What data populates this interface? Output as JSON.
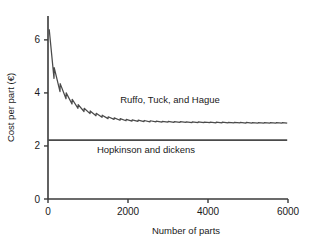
{
  "chart_data": {
    "type": "line",
    "title": "",
    "xlabel": "Number of parts",
    "ylabel": "Cost per part (€)",
    "xlim": [
      0,
      6000
    ],
    "ylim": [
      0,
      6.9
    ],
    "grid": false,
    "legend_position": "inline-annotation",
    "xticks": [
      0,
      2000,
      4000,
      6000
    ],
    "xtick_labels": [
      "0",
      "2000",
      "4000",
      "6000"
    ],
    "yticks": [
      0,
      2,
      4,
      6
    ],
    "ytick_labels": [
      "0",
      "2",
      "4",
      "6"
    ],
    "annotations": [
      {
        "text": "Ruffo, Tuck, and Hague",
        "x": 3050,
        "y": 3.62
      },
      {
        "text": "Hopkinson and dickens",
        "x": 2450,
        "y": 1.72
      }
    ],
    "series": [
      {
        "name": "Ruffo, Tuck, and Hague",
        "shape": "decaying sawtooth, batch-step cost curve",
        "asymptote": 2.88,
        "start_value": 6.4,
        "sawtooth_period_parts": 150,
        "points": [
          [
            30,
            6.4
          ],
          [
            150,
            4.55
          ],
          [
            155,
            4.95
          ],
          [
            300,
            4.05
          ],
          [
            305,
            4.35
          ],
          [
            450,
            3.78
          ],
          [
            455,
            4.0
          ],
          [
            600,
            3.58
          ],
          [
            605,
            3.76
          ],
          [
            750,
            3.42
          ],
          [
            755,
            3.56
          ],
          [
            900,
            3.3
          ],
          [
            905,
            3.42
          ],
          [
            1050,
            3.22
          ],
          [
            1055,
            3.32
          ],
          [
            1200,
            3.14
          ],
          [
            1205,
            3.23
          ],
          [
            1350,
            3.08
          ],
          [
            1355,
            3.16
          ],
          [
            1500,
            3.03
          ],
          [
            1505,
            3.1
          ],
          [
            1650,
            3.0
          ],
          [
            1655,
            3.06
          ],
          [
            1800,
            2.97
          ],
          [
            1805,
            3.03
          ],
          [
            1950,
            2.95
          ],
          [
            1955,
            3.0
          ],
          [
            2100,
            2.94
          ],
          [
            2105,
            2.98
          ],
          [
            2250,
            2.93
          ],
          [
            2255,
            2.97
          ],
          [
            2400,
            2.92
          ],
          [
            2405,
            2.96
          ],
          [
            2550,
            2.91
          ],
          [
            2555,
            2.95
          ],
          [
            2700,
            2.91
          ],
          [
            2705,
            2.94
          ],
          [
            2850,
            2.9
          ],
          [
            2855,
            2.93
          ],
          [
            3000,
            2.9
          ],
          [
            3005,
            2.93
          ],
          [
            3150,
            2.89
          ],
          [
            3155,
            2.92
          ],
          [
            3300,
            2.89
          ],
          [
            3305,
            2.92
          ],
          [
            3450,
            2.89
          ],
          [
            3455,
            2.91
          ],
          [
            3600,
            2.88
          ],
          [
            3605,
            2.91
          ],
          [
            3750,
            2.88
          ],
          [
            3755,
            2.91
          ],
          [
            3900,
            2.88
          ],
          [
            3905,
            2.9
          ],
          [
            4050,
            2.88
          ],
          [
            4055,
            2.9
          ],
          [
            4200,
            2.87
          ],
          [
            4205,
            2.9
          ],
          [
            4350,
            2.87
          ],
          [
            4355,
            2.9
          ],
          [
            4500,
            2.87
          ],
          [
            4505,
            2.89
          ],
          [
            4650,
            2.87
          ],
          [
            4655,
            2.89
          ],
          [
            4800,
            2.87
          ],
          [
            4805,
            2.89
          ],
          [
            4950,
            2.86
          ],
          [
            4955,
            2.89
          ],
          [
            5100,
            2.86
          ],
          [
            5105,
            2.88
          ],
          [
            5250,
            2.86
          ],
          [
            5255,
            2.88
          ],
          [
            5400,
            2.86
          ],
          [
            5405,
            2.88
          ],
          [
            5550,
            2.86
          ],
          [
            5555,
            2.88
          ],
          [
            5700,
            2.86
          ],
          [
            5705,
            2.88
          ],
          [
            5850,
            2.86
          ],
          [
            5855,
            2.88
          ],
          [
            5980,
            2.86
          ]
        ]
      },
      {
        "name": "Hopkinson and dickens",
        "shape": "flat horizontal line",
        "value": 2.22,
        "points": [
          [
            0,
            2.22
          ],
          [
            5980,
            2.22
          ]
        ]
      }
    ]
  }
}
